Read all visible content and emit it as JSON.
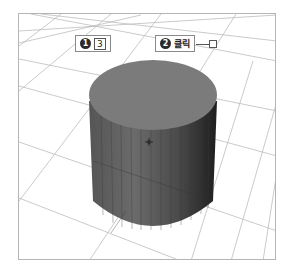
{
  "scene": {
    "type": "3d-viewport",
    "object": "cylinder",
    "colors": {
      "background": "#ffffff",
      "frame": "#b5b5b5",
      "grid": "#bdbdbd",
      "cylinder_top": "#7b7b7b",
      "cylinder_side_light": "#6a6a6a",
      "cylinder_side_dark": "#2a2a2a"
    }
  },
  "callouts": [
    {
      "number": "1",
      "key": "3",
      "text": ""
    },
    {
      "number": "2",
      "key": "",
      "text": "클릭"
    }
  ],
  "cursor": {
    "type": "crosshair",
    "x": 148,
    "y": 141
  }
}
